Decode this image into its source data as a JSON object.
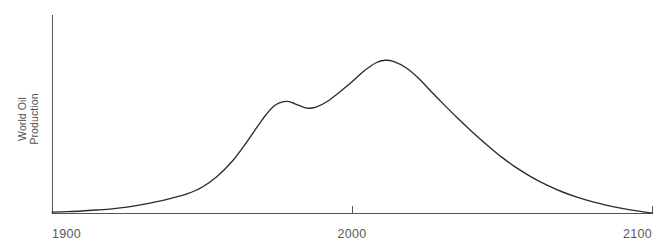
{
  "chart_data": {
    "type": "line",
    "title": "",
    "subtitle": "",
    "xlabel": "",
    "ylabel": "World Oil Production",
    "ylabel_lines": [
      "World Oil",
      "Production"
    ],
    "xlim": [
      1900,
      2100
    ],
    "ylim": [
      0,
      1
    ],
    "grid": false,
    "legend": null,
    "legend_position": "none",
    "xticks": [
      1900,
      2000,
      2100
    ],
    "xtick_labels": [
      "1900",
      "2000",
      "2100"
    ],
    "yticks": [],
    "ytick_labels": [],
    "annotations": [],
    "series": [
      {
        "name": "World Oil Production",
        "color": "#2b2b2b",
        "x": [
          1900,
          1905,
          1910,
          1915,
          1920,
          1925,
          1930,
          1935,
          1940,
          1945,
          1950,
          1955,
          1960,
          1965,
          1970,
          1974,
          1978,
          1981,
          1985,
          1988,
          1992,
          1996,
          2000,
          2004,
          2008,
          2011,
          2014,
          2018,
          2022,
          2026,
          2030,
          2035,
          2040,
          2045,
          2050,
          2055,
          2060,
          2065,
          2070,
          2075,
          2080,
          2085,
          2090,
          2095,
          2100
        ],
        "y": [
          0.005,
          0.008,
          0.012,
          0.018,
          0.025,
          0.035,
          0.05,
          0.068,
          0.09,
          0.115,
          0.155,
          0.22,
          0.31,
          0.43,
          0.56,
          0.645,
          0.672,
          0.658,
          0.632,
          0.638,
          0.675,
          0.73,
          0.79,
          0.855,
          0.905,
          0.92,
          0.912,
          0.875,
          0.815,
          0.74,
          0.665,
          0.575,
          0.49,
          0.41,
          0.335,
          0.27,
          0.215,
          0.168,
          0.128,
          0.095,
          0.068,
          0.046,
          0.028,
          0.013,
          0.0
        ]
      }
    ]
  },
  "axes": {
    "x_axis_name": "year-axis",
    "y_axis_name": "production-axis",
    "y_axis_title": "World Oil Production"
  },
  "colors": {
    "background": "#ffffff",
    "curve": "#2b2b2b",
    "axis": "#555555",
    "tick_text": "#59595c",
    "axis_title_text": "#4f4f52"
  },
  "geometry": {
    "plot_left": 52,
    "plot_right": 652,
    "baseline_y": 213,
    "plot_top": 15,
    "y_axis_top": 15
  }
}
